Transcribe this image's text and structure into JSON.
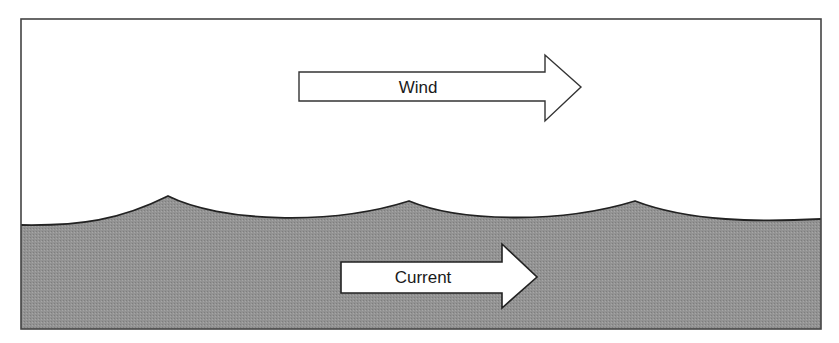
{
  "diagram": {
    "wind_arrow": {
      "label": "Wind",
      "direction": "right"
    },
    "current_arrow": {
      "label": "Current",
      "direction": "right"
    },
    "colors": {
      "water": "#909090",
      "air": "#ffffff",
      "outline": "#222222",
      "arrow_fill": "#ffffff"
    }
  }
}
